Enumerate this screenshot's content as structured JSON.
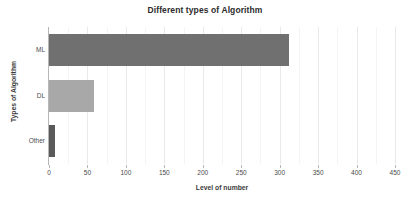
{
  "chart_data": {
    "type": "bar",
    "orientation": "horizontal",
    "title": "Different types of Algorithm",
    "xlabel": "Level of number",
    "ylabel": "Types of Algorithm",
    "categories": [
      "ML",
      "DL",
      "Other"
    ],
    "values": [
      312,
      58,
      8
    ],
    "series": [
      {
        "name": "Level of number",
        "values": [
          312,
          58,
          8
        ]
      }
    ],
    "xlim": [
      0,
      450
    ],
    "xticks": [
      0,
      50,
      100,
      150,
      200,
      250,
      300,
      350,
      400,
      450
    ],
    "xtick_labels": [
      "0",
      "50",
      "100",
      "150",
      "200",
      "250",
      "300",
      "350",
      "400",
      "450"
    ],
    "minor_tick_step": 25,
    "grid": "vertical-only",
    "legend": "none",
    "bar_colors": [
      "#707070",
      "#a8a8a8",
      "#5a5a5a"
    ],
    "background_color": "#ffffff",
    "axis_color": "#b6b6b6",
    "gridline_color": "#e9e9e9"
  }
}
